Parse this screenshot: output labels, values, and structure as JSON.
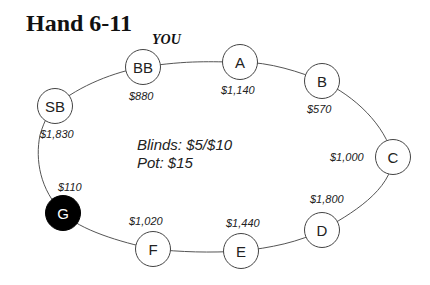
{
  "title": "Hand 6-11",
  "hero_label": "YOU",
  "info": {
    "blinds": "Blinds: $5/$10",
    "pot": "Pot: $15"
  },
  "seats": [
    {
      "id": "BB",
      "label": "BB",
      "stack": "$880",
      "hero": true
    },
    {
      "id": "A",
      "label": "A",
      "stack": "$1,140"
    },
    {
      "id": "B",
      "label": "B",
      "stack": "$570"
    },
    {
      "id": "C",
      "label": "C",
      "stack": "$1,000"
    },
    {
      "id": "D",
      "label": "D",
      "stack": "$1,800"
    },
    {
      "id": "E",
      "label": "E",
      "stack": "$1,440"
    },
    {
      "id": "F",
      "label": "F",
      "stack": "$1,020"
    },
    {
      "id": "G",
      "label": "G",
      "stack": "$110",
      "highlighted": true
    },
    {
      "id": "SB",
      "label": "SB",
      "stack": "$1,830"
    }
  ],
  "colors": {
    "line": "#555555",
    "highlight": "#000000"
  }
}
